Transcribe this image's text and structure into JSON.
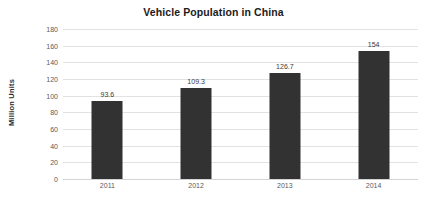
{
  "chart_data": {
    "type": "bar",
    "title": "Vehicle Population in China",
    "xlabel": "",
    "ylabel": "Million Units",
    "categories": [
      "2011",
      "2012",
      "2013",
      "2014"
    ],
    "values": [
      93.6,
      109.3,
      126.7,
      154
    ],
    "value_labels": [
      "93.6",
      "109.3",
      "126.7",
      "154"
    ],
    "ylim": [
      0,
      180
    ],
    "ytick_step": 20,
    "ytick_labels": [
      "180",
      "160",
      "140",
      "120",
      "100",
      "80",
      "60",
      "40",
      "20",
      "0"
    ],
    "ytick_values": [
      180,
      160,
      140,
      120,
      100,
      80,
      60,
      40,
      20,
      0
    ],
    "grid": "horizontal",
    "legend": "none",
    "series": [
      {
        "name": "Vehicle Population",
        "values": [
          93.6,
          109.3,
          126.7,
          154
        ],
        "color": "#323232"
      }
    ],
    "colors": {
      "bar": "#323232",
      "gridline": "#e2e2e2",
      "baseline": "#d4d4d4",
      "background": "#ffffff",
      "title_text": "#1b1b1b",
      "tick_text": "#5a5a5a",
      "value_text": "#3a3a3a",
      "axis_title_text": "#2b2b2b"
    }
  }
}
